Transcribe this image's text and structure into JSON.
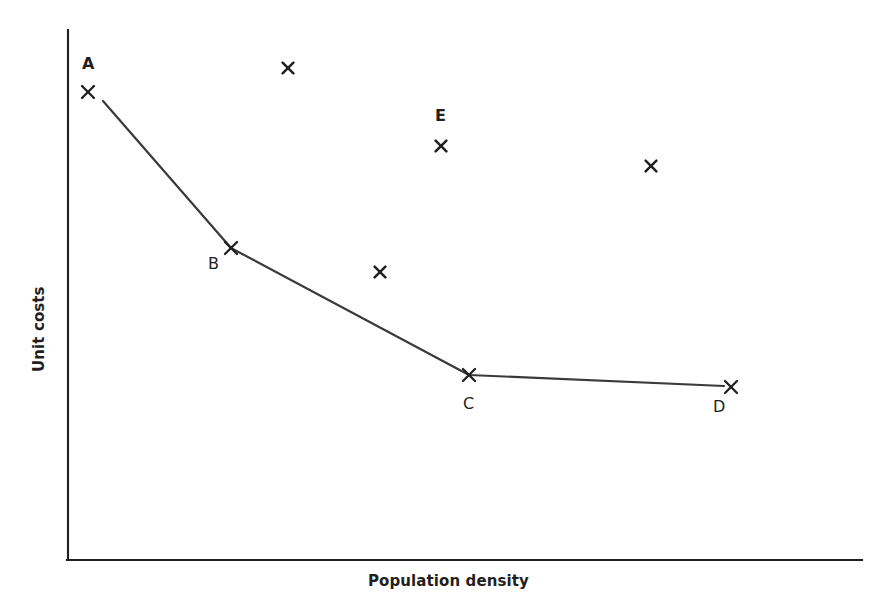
{
  "chart_data": {
    "type": "scatter",
    "title": "",
    "subtitle": "",
    "xlabel": "Population density",
    "ylabel": "Unit costs",
    "xlim": [
      0,
      100
    ],
    "ylim": [
      0,
      100
    ],
    "grid": false,
    "legend": null,
    "axes": {
      "style": "two-sided open axes, no ticks, no tick labels",
      "x_axis_line": {
        "x1": 68,
        "y1": 560,
        "x2": 862,
        "y2": 560
      },
      "y_axis_line": {
        "x1": 68,
        "y1": 30,
        "x2": 68,
        "y2": 560
      }
    },
    "series": [
      {
        "name": "Efficiency frontier",
        "type": "line",
        "marker": "x",
        "points": [
          {
            "label": "A",
            "label_bold": true,
            "x_px": 88,
            "y_px": 92,
            "label_x_px": 82,
            "label_y_px": 56,
            "x": 2.5,
            "y": 88.3
          },
          {
            "label": "B",
            "label_bold": false,
            "x_px": 231,
            "y_px": 248,
            "label_x_px": 208,
            "label_y_px": 256,
            "x": 20.5,
            "y": 58.9
          },
          {
            "label": "C",
            "label_bold": false,
            "x_px": 469,
            "y_px": 375,
            "label_x_px": 463,
            "label_y_px": 396,
            "x": 50.5,
            "y": 34.9
          },
          {
            "label": "D",
            "label_bold": false,
            "x_px": 731,
            "y_px": 387,
            "label_x_px": 713,
            "label_y_px": 399,
            "x": 83.5,
            "y": 32.6
          }
        ]
      },
      {
        "name": "Other observations",
        "type": "scatter",
        "marker": "x",
        "points": [
          {
            "label": "",
            "label_bold": false,
            "x_px": 288,
            "y_px": 68,
            "x": 27.7,
            "y": 92.8
          },
          {
            "label": "E",
            "label_bold": true,
            "x_px": 441,
            "y_px": 146,
            "label_x_px": 435,
            "label_y_px": 108,
            "x": 47.0,
            "y": 78.1
          },
          {
            "label": "",
            "label_bold": false,
            "x_px": 651,
            "y_px": 166,
            "x": 73.4,
            "y": 74.3
          },
          {
            "label": "",
            "label_bold": false,
            "x_px": 380,
            "y_px": 272,
            "x": 39.3,
            "y": 54.3
          }
        ]
      }
    ],
    "annotations": [
      {
        "text": "A",
        "role": "point-label"
      },
      {
        "text": "B",
        "role": "point-label"
      },
      {
        "text": "C",
        "role": "point-label"
      },
      {
        "text": "D",
        "role": "point-label"
      },
      {
        "text": "E",
        "role": "point-label"
      }
    ],
    "colors": {
      "axis": "#231f20",
      "line": "#3a3a3c",
      "marker": "#231f20",
      "background": "#ffffff",
      "text": "#231f20"
    }
  }
}
